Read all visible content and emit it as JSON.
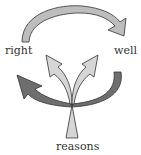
{
  "diagram": {
    "labels": {
      "left": "right",
      "right": "well",
      "bottom": "reasons"
    },
    "colors": {
      "top_arc": "#bdbdbd",
      "left_arrow": "#6e6e6e",
      "right_arc": "#6e6e6e",
      "fan_arrows": "#d6d6d6",
      "stroke": "#333333",
      "text": "#333333"
    }
  }
}
